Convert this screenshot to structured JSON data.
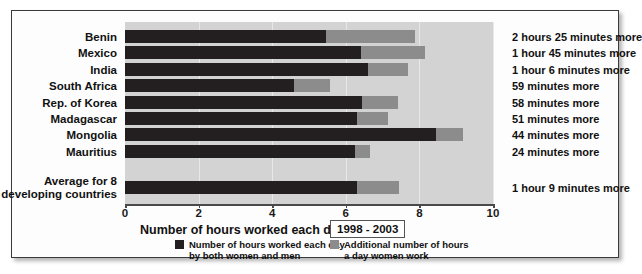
{
  "chart_data": {
    "type": "bar",
    "orientation": "horizontal",
    "stacked": true,
    "title": "",
    "xlabel": "Number of hours worked each day",
    "ylabel": "",
    "xlim": [
      0,
      10
    ],
    "xticks": [
      "0",
      "2",
      "4",
      "6",
      "8",
      "10"
    ],
    "grid": true,
    "period": "1998 - 2003",
    "categories": [
      "Benin",
      "Mexico",
      "India",
      "South Africa",
      "Rep. of Korea",
      "Madagascar",
      "Mongolia",
      "Mauritius"
    ],
    "average_category": "Average for 8\ndeveloping countries",
    "series": [
      {
        "name": "Number of hours worked each day by both women and men",
        "color": "#231f20",
        "values": [
          5.46,
          6.4,
          6.6,
          4.6,
          6.45,
          6.3,
          8.45,
          6.25
        ],
        "average_value": 6.3
      },
      {
        "name": "Additional number of hours a day women work",
        "color": "#8c8c8c",
        "values": [
          2.42,
          1.75,
          1.1,
          0.98,
          0.97,
          0.85,
          0.73,
          0.4
        ],
        "average_value": 1.15
      }
    ],
    "annotations": [
      "2 hours 25 minutes more",
      "1 hour 45 minutes more",
      "1 hour 6 minutes more",
      "59 minutes more",
      "58 minutes more",
      "51 minutes more",
      "44 minutes more",
      "24 minutes more"
    ],
    "average_annotation": "1 hour 9 minutes more",
    "legend": [
      {
        "label": "Number of hours worked each day\nby both women and men",
        "color": "#231f20"
      },
      {
        "label": "Additional number of hours\na day women work",
        "color": "#8c8c8c"
      }
    ],
    "legend_position": "bottom"
  },
  "colors": {
    "plot_background": "#d3d3d3",
    "dark_series": "#231f20",
    "light_series": "#8c8c8c",
    "axis": "#4a4a4a",
    "frame": "#3a3a3a"
  }
}
